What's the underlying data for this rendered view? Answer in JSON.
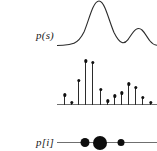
{
  "figure": {
    "background_color": "#ffffff",
    "ink_color": "#2b2b2b",
    "axis_color": "#6f6f6f"
  },
  "panels": [
    {
      "id": "p-of-s",
      "label": "p(s)"
    },
    {
      "id": "p-of-i",
      "label": "p[i]"
    },
    {
      "id": "particle-set",
      "label": "{s, m}"
    }
  ],
  "chart_data": [
    {
      "type": "line",
      "title": "p(s)",
      "xlabel": "",
      "ylabel": "p(s)",
      "grid": false,
      "legend": null,
      "xlim": [
        0,
        100
      ],
      "ylim": [
        0,
        1
      ],
      "description": "continuous bimodal probability density, tall primary mode left-of-centre and a smaller secondary mode to the right",
      "x": [
        0,
        4,
        8,
        12,
        16,
        20,
        24,
        28,
        32,
        36,
        40,
        44,
        48,
        52,
        56,
        60,
        64,
        68,
        72,
        76,
        80,
        84,
        88,
        92,
        96,
        100
      ],
      "y": [
        0.03,
        0.03,
        0.04,
        0.05,
        0.08,
        0.14,
        0.26,
        0.45,
        0.68,
        0.88,
        0.98,
        1.0,
        0.9,
        0.68,
        0.44,
        0.25,
        0.15,
        0.14,
        0.22,
        0.33,
        0.39,
        0.36,
        0.26,
        0.14,
        0.07,
        0.05
      ]
    },
    {
      "type": "bar",
      "title": "p[i]",
      "xlabel": "",
      "ylabel": "p[i]",
      "grid": false,
      "legend": null,
      "xlim": [
        0,
        100
      ],
      "ylim": [
        0,
        1
      ],
      "description": "discrete stem plot (probability mass) sampling the density above; each stem terminates in a filled circular marker",
      "categories": [
        "1",
        "2",
        "3",
        "4",
        "5",
        "6",
        "7",
        "8",
        "9",
        "10",
        "11",
        "12",
        "13"
      ],
      "x": [
        7,
        14,
        21,
        28,
        35,
        43,
        50,
        57,
        64,
        71,
        78,
        85,
        93
      ],
      "values": [
        0.22,
        0.05,
        0.53,
        0.96,
        0.92,
        0.34,
        0.09,
        0.2,
        0.26,
        0.46,
        0.38,
        0.16,
        0.06
      ]
    },
    {
      "type": "scatter",
      "title": "{s, m}",
      "xlabel": "",
      "ylabel": "",
      "grid": false,
      "legend": null,
      "xlim": [
        0,
        100
      ],
      "ylim": [
        0,
        1
      ],
      "description": "weighted particle set drawn on a one-dimensional state line; marker area encodes particle mass m",
      "x": [
        28,
        43,
        64
      ],
      "y": [
        0,
        0,
        0
      ],
      "sizes": [
        9,
        14,
        7
      ],
      "values": [
        0.28,
        0.5,
        0.2
      ]
    }
  ]
}
